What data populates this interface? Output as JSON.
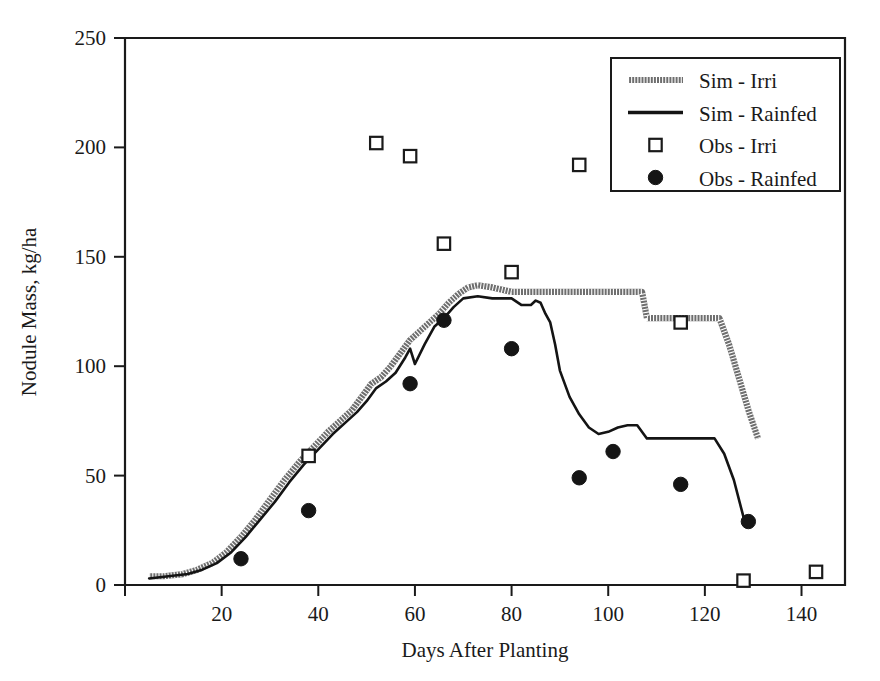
{
  "chart_data": {
    "type": "line",
    "title": "",
    "xlabel": "Days After Planting",
    "ylabel": "Nodule Mass, kg/ha",
    "xlim": [
      0,
      149
    ],
    "ylim": [
      0,
      250
    ],
    "xticks": [
      20,
      40,
      60,
      80,
      100,
      120,
      140
    ],
    "yticks": [
      0,
      50,
      100,
      150,
      200,
      250
    ],
    "xtick_labels": [
      "20",
      "40",
      "60",
      "80",
      "100",
      "120",
      "140"
    ],
    "ytick_labels": [
      "0",
      "50",
      "100",
      "150",
      "200",
      "250"
    ],
    "grid": false,
    "legend_position": "top-right",
    "series": [
      {
        "name": "Sim - Irri",
        "style": "hatched-line",
        "color": "#6e6e6e",
        "x": [
          5,
          8,
          12,
          15,
          18,
          21,
          24,
          27,
          30,
          33,
          36,
          39,
          42,
          45,
          47,
          49,
          51,
          53,
          55,
          57,
          59,
          61,
          63,
          65,
          67,
          69,
          71,
          73,
          76,
          80,
          84,
          88,
          92,
          96,
          100,
          104,
          107,
          108,
          112,
          116,
          120,
          123,
          125,
          127,
          129,
          131
        ],
        "y": [
          4,
          4,
          5,
          7,
          10,
          15,
          22,
          30,
          39,
          48,
          56,
          63,
          70,
          76,
          80,
          86,
          92,
          95,
          100,
          106,
          112,
          116,
          120,
          124,
          129,
          133,
          136,
          137,
          136,
          134,
          134,
          134,
          134,
          134,
          134,
          134,
          134,
          122,
          122,
          122,
          122,
          122,
          110,
          95,
          80,
          67
        ]
      },
      {
        "name": "Sim - Rainfed",
        "style": "solid-line",
        "color": "#141414",
        "x": [
          5,
          9,
          13,
          16,
          19,
          22,
          25,
          28,
          31,
          34,
          37,
          40,
          43,
          46,
          48,
          50,
          52,
          54,
          56,
          58,
          59,
          60,
          62,
          64,
          66,
          68,
          70,
          73,
          76,
          79,
          80,
          82,
          84,
          85,
          86,
          87,
          88,
          89,
          90,
          92,
          94,
          96,
          98,
          100,
          102,
          104,
          106,
          108,
          110,
          113,
          116,
          119,
          122,
          124,
          126,
          128
        ],
        "y": [
          3,
          4,
          5,
          7,
          10,
          15,
          22,
          30,
          38,
          47,
          55,
          62,
          69,
          75,
          79,
          84,
          90,
          93,
          97,
          104,
          108,
          101,
          110,
          118,
          122,
          127,
          131,
          132,
          131,
          131,
          131,
          128,
          128,
          130,
          129,
          124,
          120,
          110,
          98,
          86,
          78,
          72,
          69,
          70,
          72,
          73,
          73,
          67,
          67,
          67,
          67,
          67,
          67,
          60,
          48,
          31
        ]
      },
      {
        "name": "Obs - Irri",
        "style": "open-square",
        "color": "#1a1a1a",
        "x": [
          38,
          52,
          59,
          66,
          80,
          94,
          115,
          128,
          143
        ],
        "y": [
          59,
          202,
          196,
          156,
          143,
          192,
          120,
          2,
          6
        ]
      },
      {
        "name": "Obs - Rainfed",
        "style": "filled-circle",
        "color": "#151515",
        "x": [
          24,
          38,
          59,
          66,
          80,
          94,
          101,
          115,
          129
        ],
        "y": [
          12,
          34,
          92,
          121,
          108,
          49,
          61,
          46,
          29
        ]
      }
    ],
    "legend": [
      {
        "label": "Sim - Irri",
        "style": "hatched-line"
      },
      {
        "label": "Sim - Rainfed",
        "style": "solid-line"
      },
      {
        "label": "Obs - Irri",
        "style": "open-square"
      },
      {
        "label": "Obs - Rainfed",
        "style": "filled-circle"
      }
    ]
  }
}
